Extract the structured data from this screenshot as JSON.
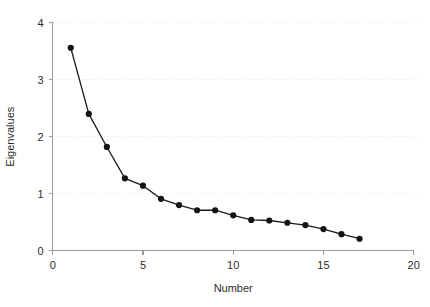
{
  "chart_data": {
    "type": "line",
    "title": "",
    "xlabel": "Number",
    "ylabel": "Eigenvalues",
    "xlim": [
      0,
      20
    ],
    "ylim": [
      0,
      4
    ],
    "xticks": [
      0,
      5,
      10,
      15,
      20
    ],
    "xtick_labels": [
      "0",
      "5",
      "10",
      "15",
      "20"
    ],
    "yticks": [
      0,
      1,
      2,
      3,
      4
    ],
    "ytick_labels": [
      "0",
      "1",
      "2",
      "3",
      "4"
    ],
    "grid": true,
    "grid_axis": "y",
    "legend": "none",
    "marker": "filled-circle",
    "line_color": "#1a1a1a",
    "marker_color": "#141414",
    "grid_color": "#e9e9e9",
    "axis_color": "#9a9a9a",
    "x": [
      1,
      2,
      3,
      4,
      5,
      6,
      7,
      8,
      9,
      10,
      11,
      12,
      13,
      14,
      15,
      16,
      17
    ],
    "values": [
      3.56,
      2.4,
      1.82,
      1.27,
      1.14,
      0.91,
      0.8,
      0.71,
      0.71,
      0.62,
      0.54,
      0.53,
      0.49,
      0.45,
      0.38,
      0.29,
      0.21
    ],
    "series": [
      {
        "name": "Eigenvalues",
        "x": [
          1,
          2,
          3,
          4,
          5,
          6,
          7,
          8,
          9,
          10,
          11,
          12,
          13,
          14,
          15,
          16,
          17
        ],
        "values": [
          3.56,
          2.4,
          1.82,
          1.27,
          1.14,
          0.91,
          0.8,
          0.71,
          0.71,
          0.62,
          0.54,
          0.53,
          0.49,
          0.45,
          0.38,
          0.29,
          0.21
        ]
      }
    ]
  }
}
